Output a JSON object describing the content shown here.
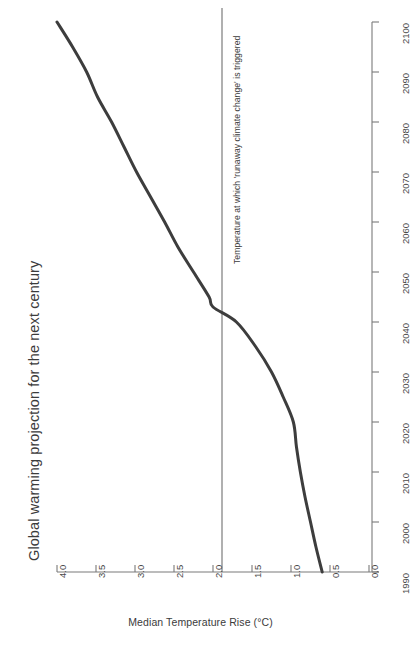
{
  "title": "Global warming projection for the next century",
  "axes": {
    "temperature_axis_title": "Median Temperature Rise (°C)",
    "temperature_ticks": [
      "4.0",
      "3.5",
      "3.0",
      "2.5",
      "2.0",
      "1.5",
      "1.0",
      "0.5",
      "0.0"
    ],
    "year_ticks": [
      "1990",
      "2000",
      "2010",
      "2020",
      "2030",
      "2040",
      "2050",
      "2060",
      "2070",
      "2080",
      "2090",
      "2100"
    ]
  },
  "annotations": {
    "threshold_label": "Temperature at which 'runaway climate change' is triggered",
    "threshold_value": "2.0"
  },
  "colors": {
    "curve": "#3d3d3d",
    "axis": "#6f6f6f",
    "threshold_line": "#6f6f6f",
    "text": "#3b3b3b",
    "background": "#ffffff"
  },
  "chart_data": {
    "type": "line",
    "title": "Global warming projection for the next century",
    "orientation": "rotated-90-ccw",
    "xlabel": "Year",
    "ylabel": "Median Temperature Rise (°C)",
    "xlim": [
      1990,
      2100
    ],
    "ylim": [
      0.0,
      4.0
    ],
    "grid": false,
    "legend": "none",
    "x": [
      1990,
      1995,
      2000,
      2005,
      2010,
      2015,
      2020,
      2025,
      2030,
      2035,
      2040,
      2043,
      2045,
      2050,
      2055,
      2060,
      2065,
      2070,
      2075,
      2080,
      2085,
      2090,
      2095,
      2100
    ],
    "series": [
      {
        "name": "Median Temperature Rise (°C)",
        "values": [
          0.6,
          0.68,
          0.75,
          0.82,
          0.88,
          0.93,
          0.97,
          1.1,
          1.25,
          1.45,
          1.7,
          2.0,
          2.05,
          2.25,
          2.45,
          2.62,
          2.8,
          2.98,
          3.14,
          3.3,
          3.48,
          3.62,
          3.8,
          4.0
        ]
      }
    ],
    "reference_lines": [
      {
        "axis": "temperature",
        "value": 2.0,
        "label": "Temperature at which 'runaway climate change' is triggered"
      }
    ],
    "ytick_values": [
      4.0,
      3.5,
      3.0,
      2.5,
      2.0,
      1.5,
      1.0,
      0.5,
      0.0
    ],
    "xtick_values": [
      1990,
      2000,
      2010,
      2020,
      2030,
      2040,
      2050,
      2060,
      2070,
      2080,
      2090,
      2100
    ]
  }
}
